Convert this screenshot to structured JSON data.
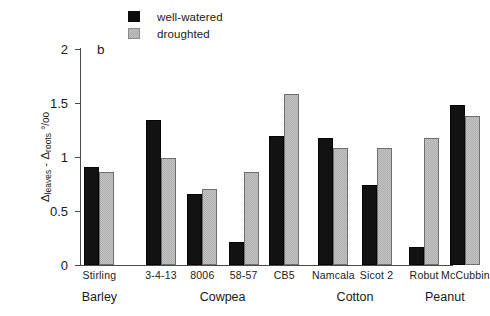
{
  "legend": {
    "items": [
      {
        "label": "well-watered",
        "swatch": "black-square-icon",
        "color": "#121212"
      },
      {
        "label": "droughted",
        "swatch": "gray-hatched-square-icon",
        "color": "#c6c6c6"
      }
    ]
  },
  "panel_letter": "b",
  "axis": {
    "y_title_main": "leaves",
    "y_title_sub1": "leaves",
    "y_title_sub2": "roots",
    "y_title_units": "°/oo",
    "y_title_full": "Δleaves - Δroots °/oo",
    "y_ticks": [
      "0",
      "0.5",
      "1",
      "1.5",
      "2"
    ]
  },
  "chart_data": {
    "type": "bar",
    "title": "",
    "subtitle": "",
    "panel_label": "b",
    "xlabel": "",
    "ylabel": "Δleaves - Δroots °/oo",
    "ylim": [
      0,
      2
    ],
    "yticks": [
      0,
      0.5,
      1,
      1.5,
      2
    ],
    "grid": false,
    "legend_position": "top-center",
    "categories": [
      "Stirling",
      "3-4-13",
      "8006",
      "58-57",
      "CB5",
      "Namcala",
      "Sicot 2",
      "Robut",
      "McCubbin"
    ],
    "groups": [
      {
        "name": "Barley",
        "categories": [
          "Stirling"
        ]
      },
      {
        "name": "Cowpea",
        "categories": [
          "3-4-13",
          "8006",
          "58-57",
          "CB5"
        ]
      },
      {
        "name": "Cotton",
        "categories": [
          "Namcala",
          "Sicot 2"
        ]
      },
      {
        "name": "Peanut",
        "categories": [
          "Robut",
          "McCubbin"
        ]
      }
    ],
    "series": [
      {
        "name": "well-watered",
        "color": "#121212",
        "values": [
          0.91,
          1.34,
          0.66,
          0.21,
          1.19,
          1.18,
          0.74,
          0.17,
          1.48
        ]
      },
      {
        "name": "droughted",
        "color": "#c6c6c6",
        "values": [
          0.86,
          0.99,
          0.7,
          0.86,
          1.58,
          1.08,
          1.08,
          1.18,
          1.38
        ]
      }
    ]
  },
  "x_axis_labels": [
    {
      "text": "Stirling",
      "center_pct": 6.2
    },
    {
      "text": "3-4-13",
      "center_pct": 29.0
    },
    {
      "text": "8006",
      "center_pct": 42.0
    },
    {
      "text": "58-57",
      "center_pct": 54.8
    },
    {
      "text": "CB5",
      "center_pct": 67.5
    },
    {
      "text": "Namcala",
      "center_pct": 103.0
    },
    {
      "text": "Sicot 2",
      "center_pct": 129.0
    },
    {
      "text": "Robut",
      "center_pct": 168.0
    },
    {
      "text": "McCubbin",
      "center_pct": 194.0
    }
  ],
  "group_axis_labels": [
    {
      "text": "Barley"
    },
    {
      "text": "Cowpea"
    },
    {
      "text": "Cotton"
    },
    {
      "text": "Peanut"
    }
  ]
}
